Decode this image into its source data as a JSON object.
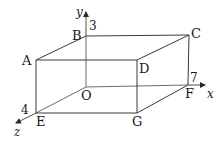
{
  "figure": {
    "type": "cuboid-3d-axes",
    "vertices": {
      "O": {
        "label": "O"
      },
      "A": {
        "label": "A"
      },
      "B": {
        "label": "B"
      },
      "C": {
        "label": "C"
      },
      "D": {
        "label": "D"
      },
      "E": {
        "label": "E"
      },
      "F": {
        "label": "F"
      },
      "G": {
        "label": "G"
      }
    },
    "axes": {
      "x": {
        "label": "x"
      },
      "y": {
        "label": "y"
      },
      "z": {
        "label": "z"
      }
    },
    "dimensions": {
      "OB": "3",
      "OF": "7",
      "OE": "4"
    },
    "colors": {
      "line": "#3a3a3a",
      "text": "#1a1a1a",
      "background": "#ffffff"
    }
  }
}
